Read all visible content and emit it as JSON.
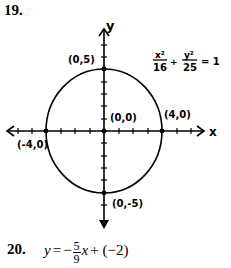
{
  "problem19": {
    "number": "19.",
    "equation": {
      "x_term_num": "x²",
      "x_term_den": "16",
      "plus": "+",
      "y_term_num": "y²",
      "y_term_den": "25",
      "equals": "= 1"
    },
    "axes": {
      "x_label": "x",
      "y_label": "y"
    },
    "points": [
      {
        "label": "(0,5)",
        "x": 0,
        "y": 5
      },
      {
        "label": "(0,0)",
        "x": 0,
        "y": 0
      },
      {
        "label": "(4,0)",
        "x": 4,
        "y": 0
      },
      {
        "label": "(-4,0)",
        "x": -4,
        "y": 0
      },
      {
        "label": "(0,-5)",
        "x": 0,
        "y": -5
      }
    ],
    "curve": {
      "type": "ellipse",
      "center": [
        0,
        0
      ],
      "semi_major_y": 5,
      "semi_minor_x": 4
    }
  },
  "problem20": {
    "number": "20.",
    "lhs": "y",
    "equals": "=",
    "minus": "−",
    "frac_num": "5",
    "frac_den": "9",
    "var": "x",
    "rest": "+ (−2)"
  }
}
